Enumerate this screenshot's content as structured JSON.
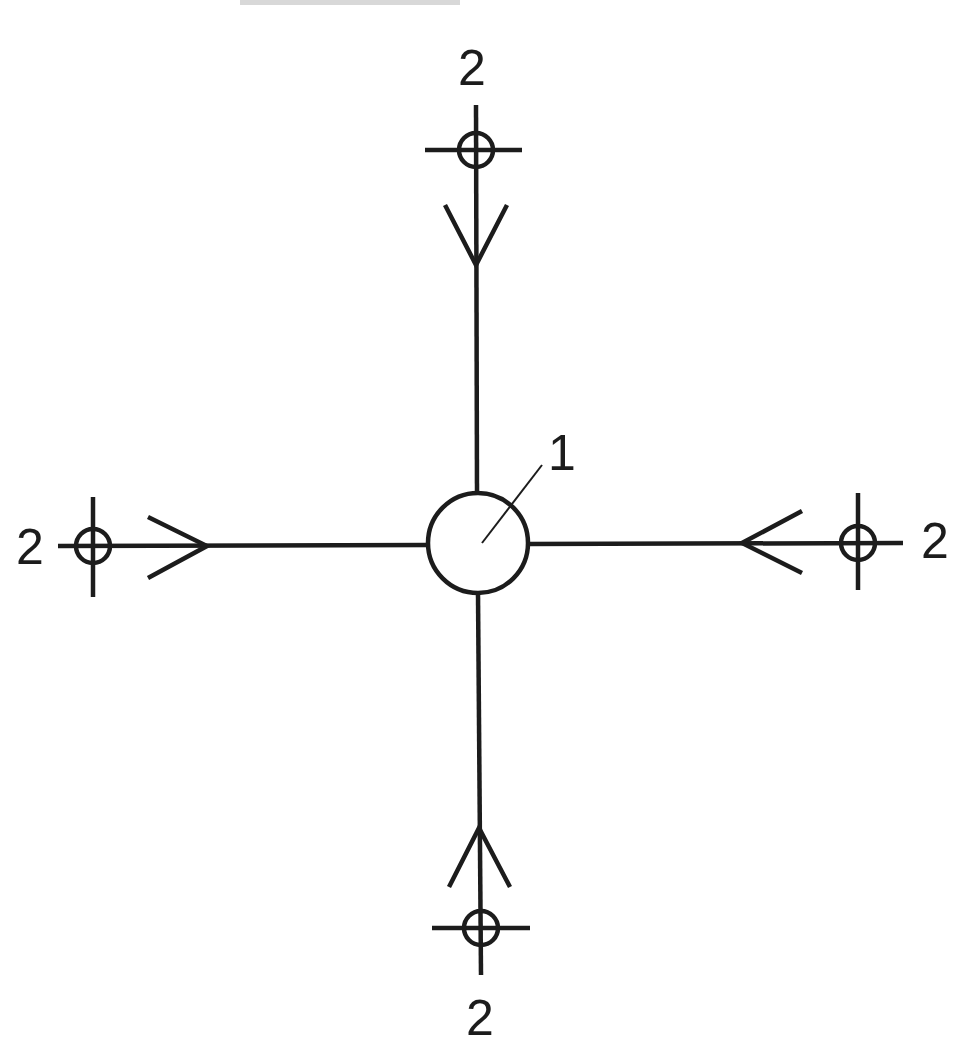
{
  "diagram": {
    "type": "schematic",
    "cropped_header_text_visible": true,
    "colors": {
      "stroke": "#1c1c1c",
      "background": "#ffffff"
    },
    "center_node": {
      "label": "1",
      "symbol": "large-circle",
      "cx": 478,
      "cy": 543,
      "r": 50,
      "leader": {
        "x1": 482,
        "y1": 543,
        "x2": 542,
        "y2": 465
      },
      "label_pos": {
        "x": 562,
        "y": 470
      }
    },
    "peripheral_nodes": [
      {
        "id": "top",
        "label": "2",
        "marker": {
          "cx": 476,
          "cy": 150,
          "r": 17
        },
        "crossbar": {
          "x1": 425,
          "y1": 150,
          "x2": 522,
          "y2": 150
        },
        "line": {
          "x1": 476,
          "y1": 105,
          "x2": 477,
          "y2": 492
        },
        "arrow": {
          "tip": [
            476,
            265
          ],
          "arm1": [
            445,
            205
          ],
          "arm2": [
            507,
            205
          ]
        },
        "label_pos": {
          "x": 472,
          "y": 85
        }
      },
      {
        "id": "left",
        "label": "2",
        "marker": {
          "cx": 93,
          "cy": 546,
          "r": 17
        },
        "crossbar": {
          "x1": 93,
          "y1": 497,
          "x2": 93,
          "y2": 597
        },
        "line": {
          "x1": 58,
          "y1": 546,
          "x2": 428,
          "y2": 545
        },
        "arrow": {
          "tip": [
            207,
            546
          ],
          "arm1": [
            148,
            517
          ],
          "arm2": [
            148,
            578
          ]
        },
        "label_pos": {
          "x": 30,
          "y": 564
        }
      },
      {
        "id": "right",
        "label": "2",
        "marker": {
          "cx": 858,
          "cy": 543,
          "r": 17
        },
        "crossbar": {
          "x1": 858,
          "y1": 493,
          "x2": 858,
          "y2": 590
        },
        "line": {
          "x1": 528,
          "y1": 544,
          "x2": 903,
          "y2": 543
        },
        "arrow": {
          "tip": [
            742,
            543
          ],
          "arm1": [
            802,
            511
          ],
          "arm2": [
            802,
            573
          ]
        },
        "label_pos": {
          "x": 935,
          "y": 558
        }
      },
      {
        "id": "bottom",
        "label": "2",
        "marker": {
          "cx": 481,
          "cy": 928,
          "r": 17
        },
        "crossbar": {
          "x1": 432,
          "y1": 928,
          "x2": 530,
          "y2": 928
        },
        "line": {
          "x1": 478,
          "y1": 593,
          "x2": 481,
          "y2": 975
        },
        "arrow": {
          "tip": [
            479,
            828
          ],
          "arm1": [
            449,
            887
          ],
          "arm2": [
            510,
            887
          ]
        },
        "label_pos": {
          "x": 480,
          "y": 1035
        }
      }
    ]
  }
}
